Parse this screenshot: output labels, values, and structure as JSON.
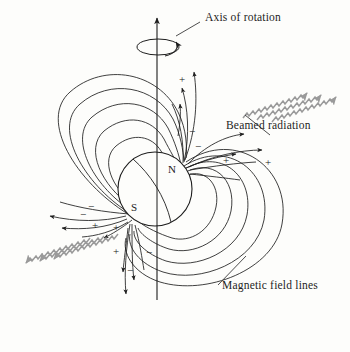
{
  "figure": {
    "kind": "pulsar-magnetic-field-diagram",
    "background_color": "#fdfdfb",
    "ink_color": "#1d1d1d",
    "beam_color": "#9a9a9a"
  },
  "labels": {
    "axis_of_rotation": "Axis of rotation",
    "beamed_radiation": "Beamed radiation",
    "magnetic_field_lines": "Magnetic field lines"
  },
  "poles": {
    "north": "N",
    "south": "S"
  },
  "charge_signs": [
    {
      "symbol": "+",
      "x": 179,
      "y": 74
    },
    {
      "symbol": "−",
      "x": 189,
      "y": 126
    },
    {
      "symbol": "−",
      "x": 195,
      "y": 141
    },
    {
      "symbol": "+",
      "x": 223,
      "y": 155
    },
    {
      "symbol": "+",
      "x": 265,
      "y": 157
    },
    {
      "symbol": "−",
      "x": 88,
      "y": 201
    },
    {
      "symbol": "−",
      "x": 80,
      "y": 209
    },
    {
      "symbol": "+",
      "x": 92,
      "y": 220
    },
    {
      "symbol": "+",
      "x": 113,
      "y": 222
    },
    {
      "symbol": "+",
      "x": 113,
      "y": 246
    },
    {
      "symbol": "−",
      "x": 146,
      "y": 247
    },
    {
      "symbol": "−",
      "x": 127,
      "y": 265
    }
  ],
  "star": {
    "center_x": 155,
    "center_y": 189,
    "radius": 37
  },
  "rotation_axis": {
    "top_x": 157,
    "top_y": 14,
    "bottom_x": 157,
    "bottom_y": 300,
    "spin_ellipse_cx": 158,
    "spin_ellipse_cy": 47,
    "spin_ellipse_rx": 21,
    "spin_ellipse_ry": 8
  },
  "beams": {
    "upper_right_count": 3,
    "lower_left_count": 3,
    "angle_degrees": 45
  }
}
